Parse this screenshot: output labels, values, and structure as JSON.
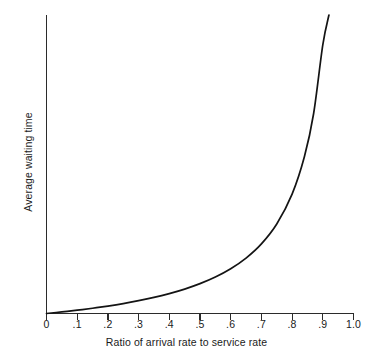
{
  "chart_data": {
    "type": "line",
    "title": "",
    "xlabel": "Ratio of arrival rate to service rate",
    "ylabel": "Average waiting time",
    "xlim": [
      0,
      1.0
    ],
    "ylim": [
      0,
      10
    ],
    "grid": false,
    "legend": null,
    "xticklabels": [
      "0",
      ".1",
      ".2",
      ".3",
      ".4",
      ".5",
      ".6",
      ".7",
      ".8",
      ".9",
      "1.0"
    ],
    "xticks": [
      0,
      0.1,
      0.2,
      0.3,
      0.4,
      0.5,
      0.6,
      0.7,
      0.8,
      0.9,
      1.0
    ],
    "yticklabels": [],
    "yticks": [],
    "series": [
      {
        "name": "Average waiting time",
        "color": "#141414",
        "x": [
          0,
          0.05,
          0.1,
          0.15,
          0.2,
          0.25,
          0.3,
          0.35,
          0.4,
          0.45,
          0.5,
          0.55,
          0.6,
          0.65,
          0.7,
          0.75,
          0.8,
          0.84,
          0.87,
          0.9,
          0.92,
          0.94,
          0.95,
          0.96,
          0.97,
          0.975,
          0.98,
          0.985,
          0.99,
          0.993,
          0.995,
          0.997,
          0.998,
          1.0
        ],
        "y": [
          0,
          0.053,
          0.111,
          0.176,
          0.25,
          0.333,
          0.429,
          0.538,
          0.667,
          0.818,
          1.0,
          1.222,
          1.5,
          1.857,
          2.333,
          3.0,
          4.0,
          5.25,
          6.692,
          9.0,
          11.5,
          15.667,
          19.0,
          24.0,
          32.333,
          39.0,
          49.0,
          65.667,
          99.0,
          141.857,
          199.0,
          332.333,
          499.0,
          null
        ]
      }
    ]
  },
  "axes": {
    "x_axis_name": "x-axis",
    "y_axis_name": "y-axis"
  }
}
